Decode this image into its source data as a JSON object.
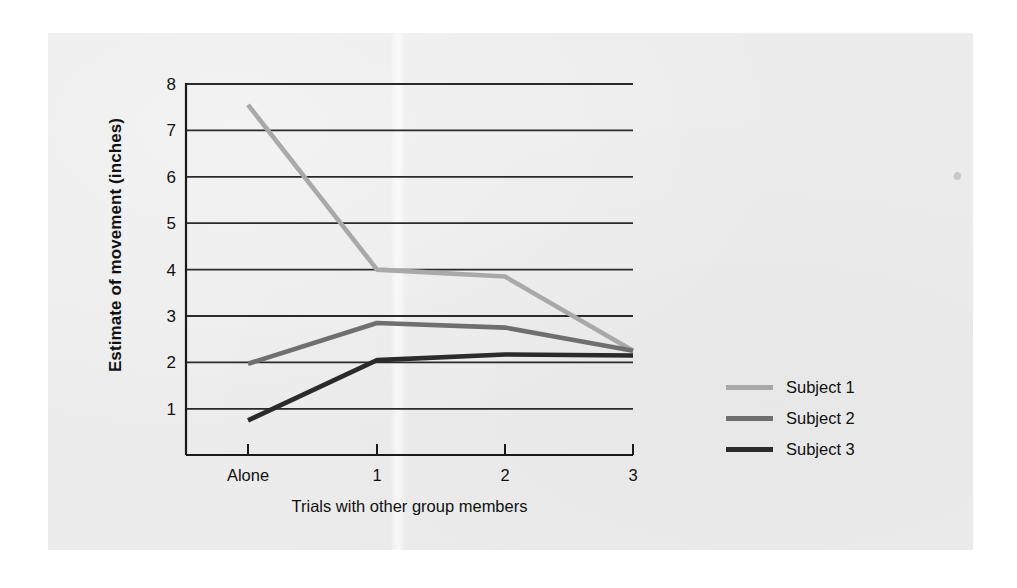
{
  "chart_data": {
    "type": "line",
    "title": "",
    "xlabel": "Trials with other group members",
    "ylabel": "Estimate of movement (inches)",
    "categories": [
      "Alone",
      "1",
      "2",
      "3"
    ],
    "x_tick_labels": [
      "Alone",
      "1",
      "2",
      "3"
    ],
    "y_tick_labels": [
      "1",
      "2",
      "3",
      "4",
      "5",
      "6",
      "7",
      "8"
    ],
    "ylim": [
      0,
      8
    ],
    "y_ticks": [
      1,
      2,
      3,
      4,
      5,
      6,
      7,
      8
    ],
    "grid": "horizontal",
    "legend_position": "right",
    "series": [
      {
        "name": "Subject 1",
        "color": "#a9a9a9",
        "values": [
          7.55,
          4.0,
          3.85,
          2.25
        ]
      },
      {
        "name": "Subject 2",
        "color": "#6f6f6f",
        "values": [
          1.97,
          2.85,
          2.75,
          2.25
        ]
      },
      {
        "name": "Subject 3",
        "color": "#2b2b2b",
        "values": [
          0.75,
          2.05,
          2.17,
          2.15
        ]
      }
    ]
  },
  "legend": {
    "items": [
      {
        "label": "Subject 1",
        "color": "#a9a9a9"
      },
      {
        "label": "Subject 2",
        "color": "#6f6f6f"
      },
      {
        "label": "Subject 3",
        "color": "#2b2b2b"
      }
    ]
  },
  "colors": {
    "page_background": "#ffffff",
    "panel_background": "#ececec",
    "axis": "#1a1a1a",
    "gridline": "#2a2a2a",
    "text": "#111111"
  },
  "axis_geometry": {
    "plot_left": 186,
    "plot_right": 633,
    "plot_top": 84,
    "plot_bottom": 455,
    "x_tick_positions": [
      248,
      377,
      505,
      633
    ],
    "y_value_top": 8,
    "y_pixel_top": 84,
    "pixels_per_unit": 46.4
  }
}
